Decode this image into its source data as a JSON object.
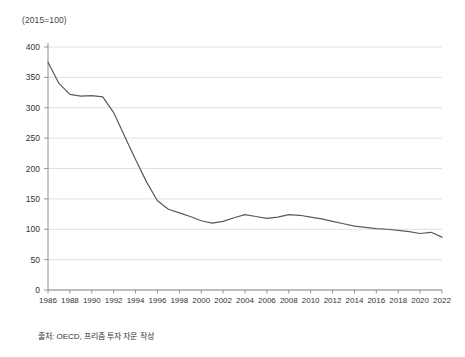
{
  "unit_label": "(2015=100)",
  "source_note": "출처: OECD, 프리즘 투자 자문 작성",
  "colors": {
    "line": "#5a5a5a",
    "grid": "#d8d8d8",
    "axis": "#8c8c8c",
    "text": "#333333",
    "background": "#ffffff"
  },
  "chart_data": {
    "type": "line",
    "title": "",
    "subtitle": "",
    "xlabel": "",
    "ylabel": "(2015=100)",
    "xlim": [
      1986,
      2022
    ],
    "ylim": [
      0,
      400
    ],
    "ytick_step": 50,
    "xtick_step": 2,
    "grid": "horizontal",
    "legend": "none",
    "yticks": [
      0,
      50,
      100,
      150,
      200,
      250,
      300,
      350,
      400
    ],
    "xticks": [
      1986,
      1988,
      1990,
      1992,
      1994,
      1996,
      1998,
      2000,
      2002,
      2004,
      2006,
      2008,
      2010,
      2012,
      2014,
      2016,
      2018,
      2020,
      2022
    ],
    "series": [
      {
        "name": "실질 주택가격지수",
        "x": [
          1986,
          1987,
          1988,
          1989,
          1990,
          1991,
          1992,
          1993,
          1994,
          1995,
          1996,
          1997,
          1998,
          1999,
          2000,
          2001,
          2002,
          2003,
          2004,
          2005,
          2006,
          2007,
          2008,
          2009,
          2010,
          2011,
          2012,
          2013,
          2014,
          2015,
          2016,
          2017,
          2018,
          2019,
          2020,
          2021,
          2022
        ],
        "values": [
          375,
          340,
          322,
          319,
          320,
          318,
          292,
          253,
          215,
          178,
          147,
          133,
          127,
          121,
          114,
          110,
          113,
          119,
          124,
          121,
          118,
          120,
          124,
          123,
          120,
          117,
          113,
          109,
          105,
          103,
          101,
          100,
          98,
          96,
          93,
          95,
          87
        ]
      }
    ]
  }
}
